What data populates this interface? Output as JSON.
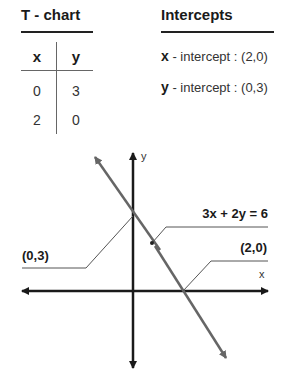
{
  "tchart": {
    "title": "T - chart",
    "headers": [
      "x",
      "y"
    ],
    "rows": [
      [
        "0",
        "3"
      ],
      [
        "2",
        "0"
      ]
    ]
  },
  "intercepts": {
    "title": "Intercepts",
    "items": [
      {
        "var": "x",
        "text": " - intercept : (2,0)"
      },
      {
        "var": "y",
        "text": " - intercept : (0,3)"
      }
    ]
  },
  "graph": {
    "x_axis_label": "x",
    "y_axis_label": "y",
    "equation": "3x + 2y = 6",
    "y_intercept_label": "(0,3)",
    "x_intercept_label": "(2,0)",
    "line_color": "#666666",
    "axis_color": "#1a1a1a"
  }
}
